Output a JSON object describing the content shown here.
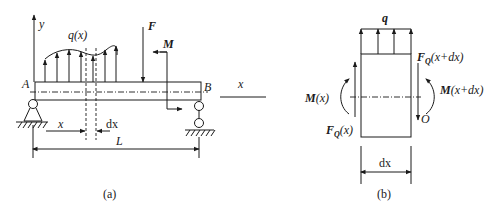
{
  "figure_a": {
    "caption": "(a)",
    "labels": {
      "y_axis": "y",
      "x_axis": "x",
      "load": "q(x)",
      "force": "F",
      "moment": "M",
      "end_a": "A",
      "end_b": "B",
      "position": "x",
      "element_width": "dx",
      "length": "L"
    }
  },
  "figure_b": {
    "caption": "(b)",
    "labels": {
      "load": "q",
      "shear_right": "F",
      "shear_right_sub": "Q",
      "shear_right_arg": "(x+dx)",
      "shear_left": "F",
      "shear_left_sub": "Q",
      "shear_left_arg": "(x)",
      "moment_left": "M",
      "moment_left_arg": "(x)",
      "moment_right": "M",
      "moment_right_arg": "(x+dx)",
      "point": "O",
      "width": "dx"
    }
  },
  "colors": {
    "ink": "#1a1a1a",
    "background": "#ffffff"
  }
}
